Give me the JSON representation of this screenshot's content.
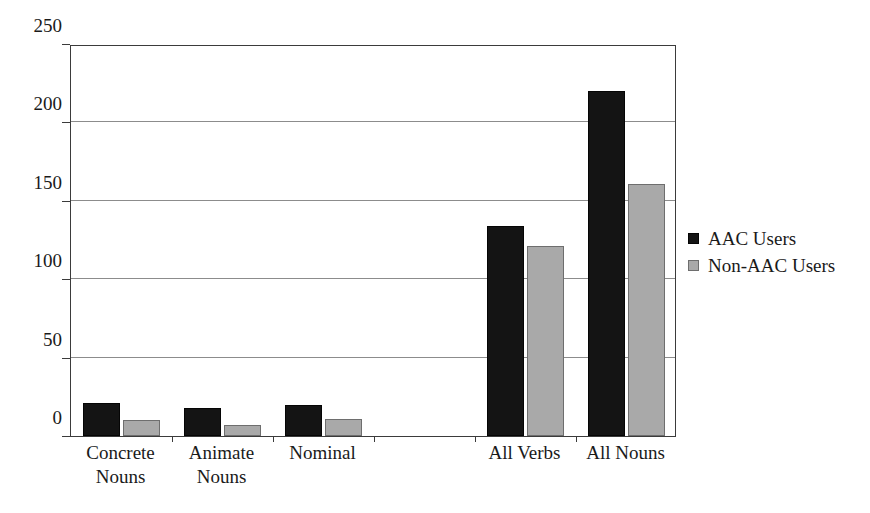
{
  "chart_data": {
    "type": "bar",
    "title": "",
    "subtitle": "",
    "xlabel": "",
    "ylabel": "",
    "ylim": [
      0,
      250
    ],
    "ytick_labels": [
      "0",
      "50",
      "100",
      "150",
      "200",
      "250"
    ],
    "yticks": [
      0,
      50,
      100,
      150,
      200,
      250
    ],
    "grid": true,
    "legend_position": "right",
    "categories": [
      "Concrete Nouns",
      "Animate Nouns",
      "Nominal",
      "",
      "All Verbs",
      "All Nouns"
    ],
    "category_lines": [
      [
        "Concrete",
        "Nouns"
      ],
      [
        "Animate",
        "Nouns"
      ],
      [
        "Nominal",
        ""
      ],
      [
        "",
        ""
      ],
      [
        "All Verbs",
        ""
      ],
      [
        "All Nouns",
        ""
      ]
    ],
    "series": [
      {
        "name": "AAC Users",
        "color": "#141414",
        "values": [
          21,
          18,
          20,
          null,
          134,
          220
        ]
      },
      {
        "name": "Non-AAC Users",
        "color": "#a9a9a9",
        "values": [
          10,
          7,
          11,
          null,
          121,
          161
        ]
      }
    ]
  },
  "legend": {
    "items": [
      {
        "label": "AAC Users",
        "swatch": "black-square-swatch"
      },
      {
        "label": "Non-AAC Users",
        "swatch": "gray-square-swatch"
      }
    ]
  },
  "axis": {
    "y_ticks": [
      "0",
      "50",
      "100",
      "150",
      "200",
      "250"
    ]
  }
}
